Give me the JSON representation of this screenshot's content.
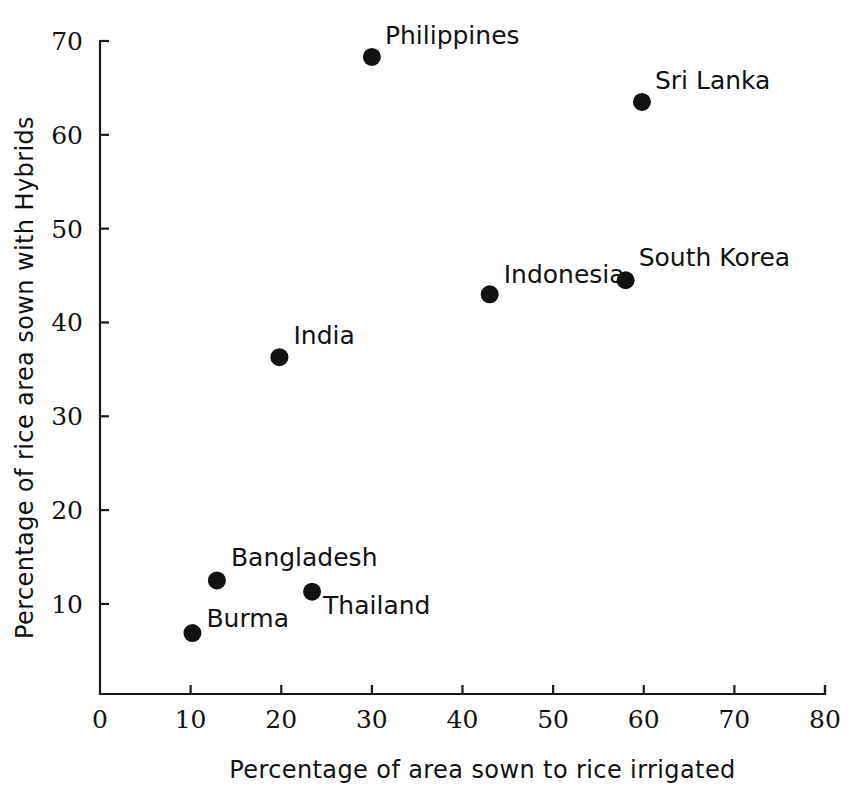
{
  "chart_data": {
    "type": "scatter",
    "title": "",
    "xlabel": "Percentage of area sown to rice irrigated",
    "ylabel": "Percentage of rice area sown with Hybrids",
    "xlim": [
      0,
      80
    ],
    "ylim": [
      0.4,
      70
    ],
    "xticks": [
      0,
      10,
      20,
      30,
      40,
      50,
      60,
      70,
      80
    ],
    "yticks": [
      10,
      20,
      30,
      40,
      50,
      60,
      70
    ],
    "xtick_labels": [
      "0",
      "10",
      "20",
      "30",
      "40",
      "50",
      "60",
      "70",
      "80"
    ],
    "ytick_labels": [
      "10",
      "20",
      "30",
      "40",
      "50",
      "60",
      "70"
    ],
    "grid": false,
    "legend": "none",
    "marker_color": "#121212",
    "axis_color": "#1a1a1a",
    "background": "#ffffff",
    "points": [
      {
        "label": "Burma",
        "x": 10.2,
        "y": 6.9,
        "label_dx": 14,
        "label_dy": -6
      },
      {
        "label": "Bangladesh",
        "x": 12.9,
        "y": 12.5,
        "label_dx": 14,
        "label_dy": -14
      },
      {
        "label": "India",
        "x": 19.8,
        "y": 36.3,
        "label_dx": 14,
        "label_dy": -13
      },
      {
        "label": "Thailand",
        "x": 23.4,
        "y": 11.3,
        "label_dx": 11,
        "label_dy": 22
      },
      {
        "label": "Philippines",
        "x": 30.0,
        "y": 68.3,
        "label_dx": 13,
        "label_dy": -13
      },
      {
        "label": "Indonesia",
        "x": 43.0,
        "y": 43.0,
        "label_dx": 14,
        "label_dy": -11
      },
      {
        "label": "South Korea",
        "x": 58.0,
        "y": 44.5,
        "label_dx": 13,
        "label_dy": -14
      },
      {
        "label": "Sri Lanka",
        "x": 59.8,
        "y": 63.5,
        "label_dx": 13,
        "label_dy": -13
      }
    ]
  },
  "geometry": {
    "plot_left_px": 100,
    "plot_right_px": 825,
    "plot_bottom_px": 694,
    "plot_top_px": 41,
    "tick_len": 9,
    "marker_radius": 9
  }
}
